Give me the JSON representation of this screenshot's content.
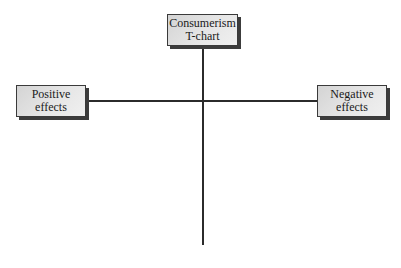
{
  "diagram": {
    "type": "t-chart",
    "title": {
      "line1": "Consumerism",
      "line2": "T-chart"
    },
    "left_column": {
      "line1": "Positive",
      "line2": "effects"
    },
    "right_column": {
      "line1": "Negative",
      "line2": "effects"
    }
  },
  "colors": {
    "line": "#2b2b2b",
    "box_fill": "#e0e0e0",
    "box_border": "#3a3a3a",
    "box_shadow": "#3c3c3c",
    "background": "#ffffff"
  }
}
